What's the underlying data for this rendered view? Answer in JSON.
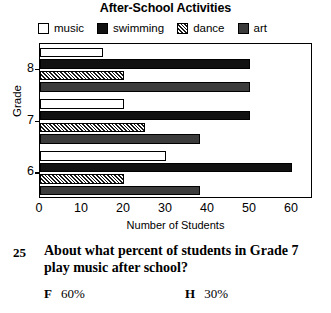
{
  "chart_data": {
    "type": "bar",
    "orientation": "horizontal",
    "title": "After-School Activities",
    "xlabel": "Number of Students",
    "ylabel": "Grade",
    "categories": [
      "8",
      "7",
      "6"
    ],
    "xlim": [
      0,
      65
    ],
    "xticks": [
      0,
      10,
      20,
      30,
      40,
      50,
      60
    ],
    "xtick_labels": [
      "0",
      "10",
      "20",
      "30",
      "40",
      "50",
      "60"
    ],
    "grid": false,
    "legend_position": "top",
    "series": [
      {
        "name": "music",
        "values": [
          15,
          20,
          30
        ],
        "fill": "white"
      },
      {
        "name": "swimming",
        "values": [
          50,
          50,
          60
        ],
        "fill": "black"
      },
      {
        "name": "dance",
        "values": [
          20,
          25,
          20
        ],
        "fill": "diagonal-hatch"
      },
      {
        "name": "art",
        "values": [
          50,
          38,
          38
        ],
        "fill": "dark-gray"
      }
    ]
  },
  "legend": {
    "items": [
      {
        "label": "music"
      },
      {
        "label": "swimming"
      },
      {
        "label": "dance"
      },
      {
        "label": "art"
      }
    ]
  },
  "question": {
    "number": "25",
    "text": "About what percent of students in Grade 7 play music after school?",
    "options": [
      {
        "letter": "F",
        "value": "60%"
      },
      {
        "letter": "H",
        "value": "30%"
      }
    ]
  }
}
